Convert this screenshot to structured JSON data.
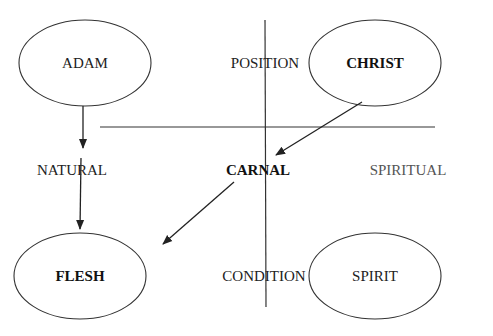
{
  "nodes": {
    "adam": {
      "label": "ADAM",
      "bold": false
    },
    "christ": {
      "label": "CHRIST",
      "bold": true
    },
    "flesh": {
      "label": "FLESH",
      "bold": true
    },
    "spirit": {
      "label": "SPIRIT",
      "bold": false
    }
  },
  "labels": {
    "position": "POSITION",
    "condition": "CONDITION",
    "natural": "NATURAL",
    "carnal": "CARNAL",
    "spiritual": "SPIRITUAL"
  },
  "edges": [
    {
      "from": "adam",
      "to": "natural"
    },
    {
      "from": "natural",
      "to": "flesh"
    },
    {
      "from": "christ",
      "to": "carnal"
    },
    {
      "from": "carnal",
      "to": "flesh"
    }
  ],
  "colors": {
    "line": "#222222",
    "text": "#222222",
    "muted_text": "#555555"
  }
}
